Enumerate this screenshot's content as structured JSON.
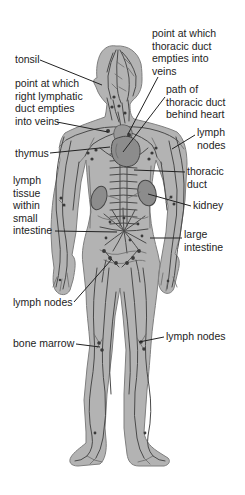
{
  "labels": [
    {
      "id": "point-thoracic-duct-veins",
      "text": "point at which\nthoracic duct\nempties into\nveins"
    },
    {
      "id": "tonsil",
      "text": "tonsil"
    },
    {
      "id": "right-lymphatic-duct-veins",
      "text": "point at which\nright lymphatic\nduct empties\ninto veins"
    },
    {
      "id": "path-thoracic-duct",
      "text": "path of\nthoracic duct\nbehind heart"
    },
    {
      "id": "lymph-nodes-axilla",
      "text": "lymph\nnodes"
    },
    {
      "id": "thymus",
      "text": "thymus"
    },
    {
      "id": "thoracic-duct",
      "text": "thoracic\nduct"
    },
    {
      "id": "lymph-tissue-small-intestine",
      "text": "lymph\ntissue\nwithin\nsmall\nintestine"
    },
    {
      "id": "kidney",
      "text": "kidney"
    },
    {
      "id": "large-intestine",
      "text": "large\nintestine"
    },
    {
      "id": "lymph-nodes-groin",
      "text": "lymph nodes"
    },
    {
      "id": "bone-marrow",
      "text": "bone marrow"
    },
    {
      "id": "lymph-nodes-knee",
      "text": "lymph nodes"
    }
  ],
  "colors": {
    "bg": "#ffffff",
    "body-fill": "#b3b3b3",
    "body-outline": "#7f7f7f",
    "vessel": "#4a4a4a",
    "vessel-light": "#6b6b6b",
    "organ-fill": "#8c8c8c",
    "organ-outline": "#454545",
    "node-fill": "#3a3a3a",
    "leader": "#222222",
    "label-text": "#1d1d1d"
  }
}
